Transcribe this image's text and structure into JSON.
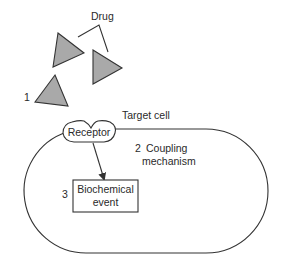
{
  "diagram": {
    "labels": {
      "drug": "Drug",
      "step1": "1",
      "target_cell": "Target cell",
      "receptor": "Receptor",
      "step2_num": "2",
      "coupling_line1": "Coupling",
      "coupling_line2": "mechanism",
      "step3_num": "3",
      "biochem_line1": "Biochemical",
      "biochem_line2": "event"
    },
    "colors": {
      "triangle_fill": "#a9a9a9",
      "stroke": "#333333",
      "background": "#ffffff"
    },
    "nodes": [
      {
        "id": "drug",
        "shape": "triangles",
        "count": 3
      },
      {
        "id": "receptor",
        "shape": "rounded-notched"
      },
      {
        "id": "target-cell",
        "shape": "stadium"
      },
      {
        "id": "biochemical-event",
        "shape": "rectangle"
      }
    ],
    "edges": [
      {
        "from": "receptor",
        "to": "biochemical-event",
        "type": "arrow"
      }
    ]
  }
}
